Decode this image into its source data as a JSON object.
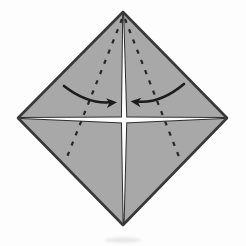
{
  "diagram": {
    "canvas": {
      "width": 246,
      "height": 246,
      "background": "#fdfdfd"
    },
    "paper": {
      "name": "paper-square",
      "points": "123,12 227,118 123,225 18,118",
      "fill": "#a8a8a8",
      "stroke": "#383838",
      "stroke_width": 2.6
    },
    "slit_style": {
      "fill": "#ffffff",
      "stroke": "#2d2d2d",
      "stroke_width": 2
    },
    "slits": [
      {
        "name": "horizontal-edge-slit",
        "points": "21,118 123.5,117.6 224,118 123.5,122.4"
      },
      {
        "name": "vertical-center-slit",
        "points": "123.2,15 126.3,119.5 123.6,222 121.9,119.5"
      }
    ],
    "fold_line_style": {
      "stroke": "#262626",
      "width": 2.2,
      "dash": "4.2 6.8"
    },
    "fold_lines": [
      {
        "name": "valley-fold-line-left",
        "x1": 122,
        "y1": 19,
        "x2": 65,
        "y2": 162
      },
      {
        "name": "valley-fold-line-right",
        "x1": 125,
        "y1": 19,
        "x2": 181,
        "y2": 162
      }
    ],
    "arrow_style": {
      "stroke": "#1b1b1b",
      "width": 2.6
    },
    "arrows": [
      {
        "name": "fold-arrow-left",
        "path": "M 64,86 Q 87,104 110,102.3",
        "head": "117,102.3 106.1,98.3 109.4,102.8 106.9,108"
      },
      {
        "name": "fold-arrow-right",
        "path": "M 184,84 Q 160,104 137,101.5",
        "head": "130.6,101.3 141.5,97.7 137.9,102 140.5,107.2"
      }
    ],
    "shadow": {
      "name": "scan-smudge",
      "cx": 123,
      "cy": 240,
      "rx": 18,
      "ry": 2.6,
      "fill": "#6f6f6f",
      "opacity": 0.16
    }
  }
}
